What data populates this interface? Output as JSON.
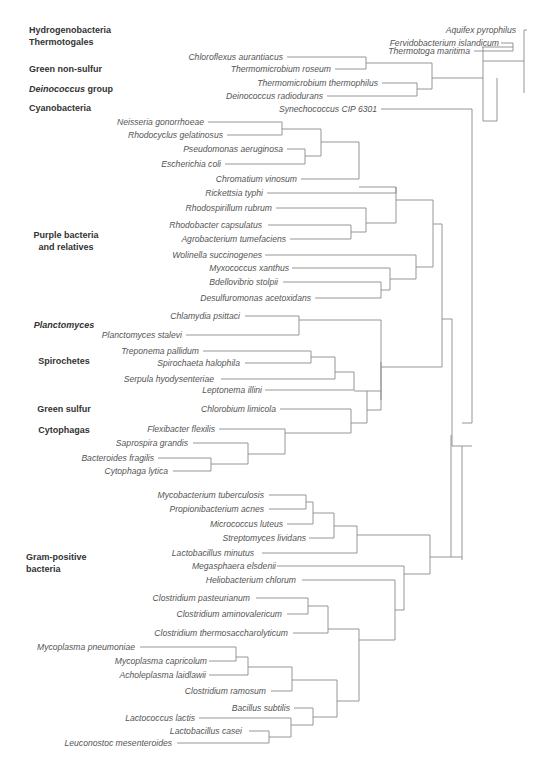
{
  "diagram": {
    "type": "phylogenetic-tree",
    "colors": {
      "branch": "#8a8a8a",
      "taxon_text": "#555555",
      "group_text": "#333333",
      "background": "#ffffff"
    },
    "groups": [
      {
        "id": "hydrogenobacteria",
        "lines": [
          [
            "Hydrogenobacteria",
            false
          ]
        ],
        "x": 29,
        "y": 33,
        "anchor": "start"
      },
      {
        "id": "thermotogales",
        "lines": [
          [
            "Thermotogales",
            false
          ]
        ],
        "x": 29,
        "y": 45,
        "anchor": "start"
      },
      {
        "id": "green-non-sulfur",
        "lines": [
          [
            "Green non-sulfur",
            false
          ]
        ],
        "x": 29,
        "y": 72,
        "anchor": "start"
      },
      {
        "id": "deinococcus-group",
        "lines": [
          [
            "Deinococcus",
            true
          ],
          [
            " group",
            false
          ]
        ],
        "x": 29,
        "y": 92,
        "anchor": "start"
      },
      {
        "id": "cyanobacteria",
        "lines": [
          [
            "Cyanobacteria",
            false
          ]
        ],
        "x": 29,
        "y": 111,
        "anchor": "start"
      },
      {
        "id": "purple-bacteria",
        "lines": [
          [
            "Purple bacteria",
            false
          ]
        ],
        "x": 66,
        "y": 238,
        "anchor": "middle"
      },
      {
        "id": "purple-bacteria-2",
        "lines": [
          [
            "and relatives",
            false
          ]
        ],
        "x": 66,
        "y": 250,
        "anchor": "middle"
      },
      {
        "id": "planctomyces",
        "lines": [
          [
            "Planctomyces",
            true
          ]
        ],
        "x": 64,
        "y": 328,
        "anchor": "middle"
      },
      {
        "id": "spirochetes",
        "lines": [
          [
            "Spirochetes",
            false
          ]
        ],
        "x": 64,
        "y": 364,
        "anchor": "middle"
      },
      {
        "id": "green-sulfur",
        "lines": [
          [
            "Green sulfur",
            false
          ]
        ],
        "x": 64,
        "y": 412,
        "anchor": "middle"
      },
      {
        "id": "cytophagas",
        "lines": [
          [
            "Cytophagas",
            false
          ]
        ],
        "x": 64,
        "y": 433,
        "anchor": "middle"
      },
      {
        "id": "gram-positive",
        "lines": [
          [
            "Gram-positive",
            false
          ]
        ],
        "x": 26,
        "y": 560,
        "anchor": "start"
      },
      {
        "id": "gram-positive-2",
        "lines": [
          [
            "bacteria",
            false
          ]
        ],
        "x": 26,
        "y": 572,
        "anchor": "start"
      }
    ],
    "taxa": [
      {
        "name": "Aquifex pyrophilus",
        "text_end": 516,
        "y": 30,
        "tip": 527,
        "line_end": 524
      },
      {
        "name": "Fervidobacterium islandicum",
        "text_end": 499,
        "y": 43,
        "tip": 501,
        "line_end": 513
      },
      {
        "name": "Thermotoga maritima",
        "text_end": 470,
        "y": 51,
        "tip": 474,
        "line_end": 513
      },
      {
        "name": "Chloroflexus aurantiacus",
        "text_end": 283,
        "y": 57,
        "tip": 287,
        "line_end": 366
      },
      {
        "name": "Thermomicrobium roseum",
        "text_end": 331,
        "y": 69,
        "tip": 335,
        "line_end": 366
      },
      {
        "name": "Thermomicrobium thermophilus",
        "text_end": 378,
        "y": 83,
        "tip": 382,
        "line_end": 417
      },
      {
        "name": "Deinococcus radiodurans",
        "text_end": 323,
        "y": 96,
        "tip": 327,
        "line_end": 417
      },
      {
        "name": "Synechococcus CIP 6301",
        "text_end": 377,
        "y": 109,
        "tip": 381,
        "line_end": 472
      },
      {
        "name": "Neisseria gonorrhoeae",
        "text_end": 204,
        "y": 122,
        "tip": 208,
        "line_end": 282
      },
      {
        "name": "Rhodocyclus gelatinosus",
        "text_end": 223,
        "y": 135,
        "tip": 227,
        "line_end": 282
      },
      {
        "name": "Pseudomonas aeruginosa",
        "text_end": 283,
        "y": 149,
        "tip": 287,
        "line_end": 305
      },
      {
        "name": "Escherichia coli",
        "text_end": 221,
        "y": 164,
        "tip": 225,
        "line_end": 305
      },
      {
        "name": "Chromatium vinosum",
        "text_end": 297,
        "y": 179,
        "tip": 301,
        "line_end": 359
      },
      {
        "name": "Rickettsia typhi",
        "text_end": 263,
        "y": 193,
        "tip": 267,
        "line_end": 396
      },
      {
        "name": "Rhodospirillum rubrum",
        "text_end": 272,
        "y": 208,
        "tip": 276,
        "line_end": 366
      },
      {
        "name": "Rhodobacter capsulatus",
        "text_end": 262,
        "y": 225,
        "tip": 268,
        "line_end": 351
      },
      {
        "name": "Agrobacterium tumefaciens",
        "text_end": 286,
        "y": 239,
        "tip": 290,
        "line_end": 351
      },
      {
        "name": "Wolinella succinogenes",
        "text_end": 262,
        "y": 255,
        "tip": 265,
        "line_end": 416
      },
      {
        "name": "Myxococcus xanthus",
        "text_end": 289,
        "y": 268,
        "tip": 292,
        "line_end": 390
      },
      {
        "name": "Bdellovibrio stolpii",
        "text_end": 278,
        "y": 282,
        "tip": 283,
        "line_end": 381
      },
      {
        "name": "Desulfuromonas acetoxidans",
        "text_end": 311,
        "y": 298,
        "tip": 315,
        "line_end": 381
      },
      {
        "name": "Chlamydia psittaci",
        "text_end": 240,
        "y": 316,
        "tip": 245,
        "line_end": 299
      },
      {
        "name": "Planctomyces stalevi",
        "text_end": 182,
        "y": 335,
        "tip": 186,
        "line_end": 299
      },
      {
        "name": "Treponema pallidum",
        "text_end": 199,
        "y": 351,
        "tip": 203,
        "line_end": 311
      },
      {
        "name": "Spirochaeta halophila",
        "text_end": 240,
        "y": 363,
        "tip": 245,
        "line_end": 311
      },
      {
        "name": "Serpula hyodysenteriae",
        "text_end": 214,
        "y": 379,
        "tip": 221,
        "line_end": 335
      },
      {
        "name": "Leptonema illini",
        "text_end": 262,
        "y": 390,
        "tip": 265,
        "line_end": 354
      },
      {
        "name": "Chlorobium limicola",
        "text_end": 276,
        "y": 409,
        "tip": 280,
        "line_end": 351
      },
      {
        "name": "Flexibacter flexilis",
        "text_end": 215,
        "y": 429,
        "tip": 219,
        "line_end": 285
      },
      {
        "name": "Saprospira grandis",
        "text_end": 188,
        "y": 443,
        "tip": 193,
        "line_end": 248
      },
      {
        "name": "Bacteroides fragilis",
        "text_end": 154,
        "y": 458,
        "tip": 158,
        "line_end": 211
      },
      {
        "name": "Cytophaga lytica",
        "text_end": 168,
        "y": 471,
        "tip": 173,
        "line_end": 211
      },
      {
        "name": "Mycobacterium tuberculosis",
        "text_end": 264,
        "y": 495,
        "tip": 269,
        "line_end": 306
      },
      {
        "name": "Propionibacterium acnes",
        "text_end": 264,
        "y": 509,
        "tip": 269,
        "line_end": 306
      },
      {
        "name": "Micrococcus luteus",
        "text_end": 283,
        "y": 524,
        "tip": 287,
        "line_end": 313
      },
      {
        "name": "Streptomyces lividans",
        "text_end": 306,
        "y": 538,
        "tip": 309,
        "line_end": 334
      },
      {
        "name": "Lactobacillus minutus",
        "text_end": 254,
        "y": 553,
        "tip": 262,
        "line_end": 357
      },
      {
        "name": "Megasphaera elsdenii",
        "text_end": 276,
        "y": 566,
        "tip": 277,
        "line_end": 404
      },
      {
        "name": "Heliobacterium chlorum",
        "text_end": 296,
        "y": 580,
        "tip": 302,
        "line_end": 395
      },
      {
        "name": "Clostridium pasteurianum",
        "text_end": 250,
        "y": 598,
        "tip": 256,
        "line_end": 308
      },
      {
        "name": "Clostridium aminovalericum",
        "text_end": 282,
        "y": 614,
        "tip": 287,
        "line_end": 308
      },
      {
        "name": "Clostridium thermosaccharolyticum",
        "text_end": 288,
        "y": 633,
        "tip": 293,
        "line_end": 328
      },
      {
        "name": "Mycoplasma pneumoniae",
        "text_end": 135,
        "y": 647,
        "tip": 140,
        "line_end": 236
      },
      {
        "name": "Mycoplasma capricolum",
        "text_end": 207,
        "y": 661,
        "tip": 209,
        "line_end": 236
      },
      {
        "name": "Acholeplasma laidlawii",
        "text_end": 206,
        "y": 675,
        "tip": 209,
        "line_end": 248
      },
      {
        "name": "Clostridium ramosum",
        "text_end": 266,
        "y": 691,
        "tip": 271,
        "line_end": 292
      },
      {
        "name": "Bacillus subtilis",
        "text_end": 290,
        "y": 708,
        "tip": 294,
        "line_end": 313
      },
      {
        "name": "Lactococcus lactis",
        "text_end": 195,
        "y": 718,
        "tip": 199,
        "line_end": 291
      },
      {
        "name": "Lactobacillus casei",
        "text_end": 242,
        "y": 731,
        "tip": 249,
        "line_end": 269
      },
      {
        "name": "Leuconostoc mesenteroides",
        "text_end": 172,
        "y": 743,
        "tip": 177,
        "line_end": 269
      }
    ],
    "vlines": [
      [
        513,
        43,
        51
      ],
      [
        524,
        30,
        93
      ],
      [
        366,
        57,
        69
      ],
      [
        417,
        83,
        96
      ],
      [
        432,
        63,
        89
      ],
      [
        483,
        47,
        121
      ],
      [
        497,
        78,
        121
      ],
      [
        282,
        122,
        135
      ],
      [
        305,
        149,
        164
      ],
      [
        321,
        129,
        156
      ],
      [
        359,
        142,
        179
      ],
      [
        396,
        187,
        193
      ],
      [
        351,
        225,
        239
      ],
      [
        366,
        208,
        232
      ],
      [
        381,
        282,
        298
      ],
      [
        390,
        268,
        290
      ],
      [
        416,
        255,
        279
      ],
      [
        396,
        187,
        223
      ],
      [
        433,
        200,
        267
      ],
      [
        299,
        316,
        335
      ],
      [
        311,
        351,
        363
      ],
      [
        335,
        357,
        379
      ],
      [
        354,
        372,
        390
      ],
      [
        381,
        362,
        400
      ],
      [
        211,
        458,
        471
      ],
      [
        248,
        443,
        464
      ],
      [
        285,
        429,
        454
      ],
      [
        351,
        409,
        433
      ],
      [
        367,
        391,
        423
      ],
      [
        381,
        320,
        410
      ],
      [
        442,
        224,
        367
      ],
      [
        452,
        319,
        446
      ],
      [
        472,
        109,
        423
      ],
      [
        306,
        495,
        509
      ],
      [
        313,
        502,
        524
      ],
      [
        334,
        513,
        538
      ],
      [
        357,
        526,
        553
      ],
      [
        404,
        566,
        610
      ],
      [
        395,
        580,
        640
      ],
      [
        308,
        598,
        614
      ],
      [
        328,
        606,
        633
      ],
      [
        359,
        629,
        701
      ],
      [
        236,
        647,
        661
      ],
      [
        248,
        657,
        675
      ],
      [
        292,
        667,
        691
      ],
      [
        269,
        731,
        743
      ],
      [
        291,
        718,
        737
      ],
      [
        313,
        708,
        725
      ],
      [
        337,
        680,
        717
      ],
      [
        430,
        535,
        574
      ],
      [
        451,
        435,
        557
      ],
      [
        462,
        446,
        560
      ]
    ],
    "hlines": [
      [
        482,
        513,
        47
      ],
      [
        483,
        524,
        61
      ],
      [
        366,
        432,
        63
      ],
      [
        417,
        432,
        89
      ],
      [
        432,
        483,
        78
      ],
      [
        483,
        497,
        121
      ],
      [
        282,
        321,
        129
      ],
      [
        305,
        321,
        156
      ],
      [
        321,
        359,
        142
      ],
      [
        359,
        396,
        187
      ],
      [
        366,
        396,
        223
      ],
      [
        351,
        366,
        232
      ],
      [
        390,
        416,
        279
      ],
      [
        381,
        390,
        290
      ],
      [
        396,
        433,
        200
      ],
      [
        416,
        433,
        267
      ],
      [
        433,
        442,
        224
      ],
      [
        299,
        381,
        320
      ],
      [
        311,
        335,
        357
      ],
      [
        335,
        354,
        372
      ],
      [
        354,
        381,
        391
      ],
      [
        211,
        248,
        464
      ],
      [
        248,
        285,
        454
      ],
      [
        285,
        351,
        433
      ],
      [
        351,
        367,
        423
      ],
      [
        367,
        381,
        410
      ],
      [
        381,
        442,
        367
      ],
      [
        442,
        452,
        319
      ],
      [
        452,
        472,
        446
      ],
      [
        306,
        313,
        502
      ],
      [
        313,
        334,
        513
      ],
      [
        334,
        357,
        526
      ],
      [
        357,
        430,
        535
      ],
      [
        308,
        328,
        606
      ],
      [
        328,
        359,
        629
      ],
      [
        236,
        248,
        657
      ],
      [
        248,
        292,
        667
      ],
      [
        292,
        337,
        680
      ],
      [
        269,
        291,
        737
      ],
      [
        291,
        313,
        725
      ],
      [
        313,
        337,
        717
      ],
      [
        337,
        359,
        701
      ],
      [
        359,
        395,
        640
      ],
      [
        395,
        404,
        610
      ],
      [
        404,
        430,
        574
      ],
      [
        430,
        451,
        557
      ],
      [
        451,
        462,
        557
      ],
      [
        462,
        472,
        423
      ]
    ]
  }
}
